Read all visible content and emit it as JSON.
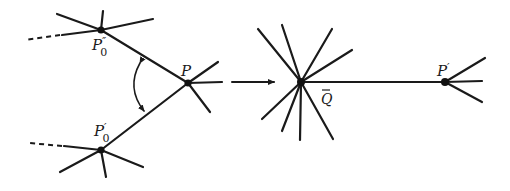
{
  "figure": {
    "colors": {
      "ink": "#1a1a1a",
      "background": "#ffffff"
    },
    "left_panel": {
      "nodes": [
        {
          "id": "P0pp",
          "label": "P",
          "prime": "″",
          "subscript": "0",
          "x": 101,
          "y": 30
        },
        {
          "id": "P",
          "label": "P",
          "prime": "",
          "subscript": "",
          "x": 188,
          "y": 83
        },
        {
          "id": "P0p",
          "label": "P",
          "prime": "′",
          "subscript": "0",
          "x": 101,
          "y": 150
        }
      ],
      "rotation_arrow": "double-headed-arc"
    },
    "transition_arrow": "right-arrow",
    "right_panel": {
      "nodes": [
        {
          "id": "Qbar",
          "label": "Q",
          "accent": "bar",
          "x": 301,
          "y": 82
        },
        {
          "id": "Pp",
          "label": "P",
          "prime": "′",
          "x": 445,
          "y": 82
        }
      ]
    }
  },
  "labels": {
    "p0_double_prime": "P",
    "p0_double_prime_mark": "″",
    "p0_double_prime_sub": "0",
    "p": "P",
    "p0_prime": "P",
    "p0_prime_mark": "′",
    "p0_prime_sub": "0",
    "q_bar": "Q",
    "q_bar_accent": "‾",
    "p_prime": "P",
    "p_prime_mark": "′"
  }
}
